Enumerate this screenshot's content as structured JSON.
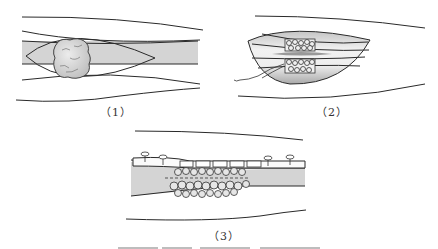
{
  "figure": {
    "panels": [
      {
        "id": "1",
        "label": "（1）",
        "description": "bone with tumor mass inside elliptical excision outline"
      },
      {
        "id": "2",
        "label": "（2）",
        "description": "excised segment with bone graft blocks tied by suture"
      },
      {
        "id": "3",
        "label": "（3）",
        "description": "bone graft cluster fixed with plate and screws"
      }
    ],
    "colors": {
      "line": "#2a2a2a",
      "bone": "#d4d4d4",
      "bone_dark": "#b8b8b8",
      "graft_fill": "#e6e6e6"
    },
    "caption_partial": "cut off at bottom edge"
  }
}
